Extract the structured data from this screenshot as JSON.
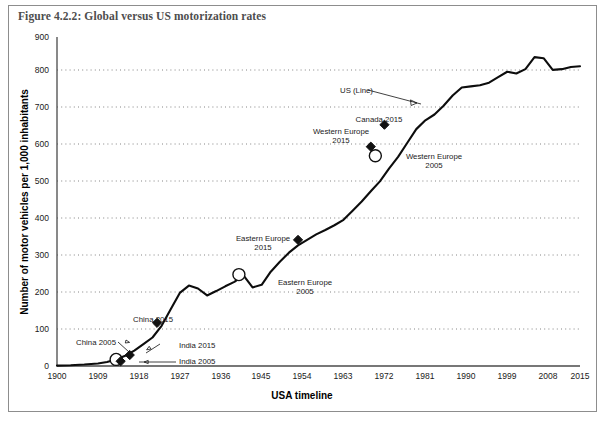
{
  "figure": {
    "caption": "Figure 4.2.2: Global versus US motorization rates"
  },
  "chart_data": {
    "type": "line",
    "title": "Figure 4.2.2: Global versus US motorization rates",
    "xlabel": "USA timeline",
    "ylabel": "Number of motor vehicles per 1,000 inhabitants",
    "xlim": [
      1900,
      2015
    ],
    "ylim": [
      0,
      900
    ],
    "grid": true,
    "legend_position": "inline-annotation",
    "yticks": [
      0,
      100,
      200,
      300,
      400,
      500,
      600,
      700,
      800,
      900
    ],
    "xticks": [
      1900,
      1909,
      1918,
      1927,
      1936,
      1945,
      1954,
      1963,
      1972,
      1981,
      1990,
      1999,
      2008,
      2015
    ],
    "series": [
      {
        "name": "US (Line)",
        "x": [
          1900,
          1903,
          1906,
          1909,
          1911,
          1913,
          1915,
          1917,
          1919,
          1921,
          1923,
          1925,
          1927,
          1929,
          1931,
          1933,
          1935,
          1937,
          1939,
          1941,
          1943,
          1945,
          1947,
          1949,
          1951,
          1953,
          1955,
          1957,
          1959,
          1961,
          1963,
          1965,
          1967,
          1969,
          1971,
          1973,
          1975,
          1977,
          1979,
          1981,
          1983,
          1985,
          1987,
          1989,
          1991,
          1993,
          1995,
          1997,
          1999,
          2001,
          2003,
          2005,
          2007,
          2009,
          2011,
          2013,
          2015
        ],
        "y": [
          1,
          2,
          4,
          7,
          11,
          18,
          28,
          42,
          60,
          78,
          110,
          155,
          200,
          220,
          212,
          193,
          205,
          218,
          230,
          248,
          215,
          222,
          258,
          285,
          310,
          330,
          345,
          360,
          372,
          385,
          400,
          425,
          450,
          478,
          505,
          540,
          572,
          610,
          648,
          672,
          688,
          712,
          740,
          762,
          765,
          768,
          775,
          790,
          805,
          800,
          812,
          845,
          842,
          810,
          812,
          818,
          820
        ],
        "style": "solid-black-line"
      }
    ],
    "markers": [
      {
        "label": "China 2005",
        "year": 1913,
        "value": 18,
        "marker": "open-circle",
        "label_x": 1906,
        "label_y": 48
      },
      {
        "label": "China 2015",
        "year": 1922,
        "value": 118,
        "marker": "filled-diamond",
        "label_x": 1921,
        "label_y": 155
      },
      {
        "label": "India 2005",
        "year": 1914,
        "value": 13,
        "marker": "filled-diamond",
        "label_x": 1940,
        "label_y": 12
      },
      {
        "label": "India 2015",
        "year": 1916,
        "value": 30,
        "marker": "filled-diamond",
        "label_x": 1941,
        "label_y": 46
      },
      {
        "label": "Eastern Europe 2005",
        "year": 1940,
        "value": 250,
        "marker": "open-circle",
        "label_x": 1952,
        "label_y": 196
      },
      {
        "label": "Eastern Europe 2015",
        "year": 1953,
        "value": 345,
        "marker": "filled-diamond",
        "label_x": 1945,
        "label_y": 382
      },
      {
        "label": "Western Europe 2005",
        "year": 1970,
        "value": 575,
        "marker": "open-circle",
        "label_x": 1985,
        "label_y": 552
      },
      {
        "label": "Western Europe 2015",
        "year": 1969,
        "value": 600,
        "marker": "filled-diamond",
        "label_x": 1960,
        "label_y": 640
      },
      {
        "label": "Canada 2015",
        "year": 1972,
        "value": 660,
        "marker": "filled-diamond",
        "label_x": 1963,
        "label_y": 700
      }
    ],
    "annotations": [
      {
        "label": "US (Line)",
        "label_x": 1963,
        "label_y": 768,
        "target_x": 1978,
        "target_y": 738
      }
    ]
  },
  "axis": {
    "y_title": "Number of motor vehicles per 1,000 inhabitants",
    "x_title": "USA timeline",
    "y_labels": [
      "0",
      "100",
      "200",
      "300",
      "400",
      "500",
      "600",
      "700",
      "800",
      "900"
    ],
    "x_labels": [
      "1900",
      "1909",
      "1918",
      "1927",
      "1936",
      "1945",
      "1954",
      "1963",
      "1972",
      "1981",
      "1990",
      "1999",
      "2008",
      "2015"
    ]
  },
  "labels": {
    "china_2005": "China 2005",
    "china_2015": "China 2015",
    "india_2005": "India 2005",
    "india_2015": "India 2015",
    "eastern_europe_2005_l1": "Eastern Europe",
    "eastern_europe_2005_l2": "2005",
    "eastern_europe_2015_l1": "Eastern Europe",
    "eastern_europe_2015_l2": "2015",
    "western_europe_2005_l1": "Western Europe",
    "western_europe_2005_l2": "2005",
    "western_europe_2015_l1": "Western Europe",
    "western_europe_2015_l2": "2015",
    "canada_2015": "Canada 2015",
    "us_line": "US (Line)"
  }
}
